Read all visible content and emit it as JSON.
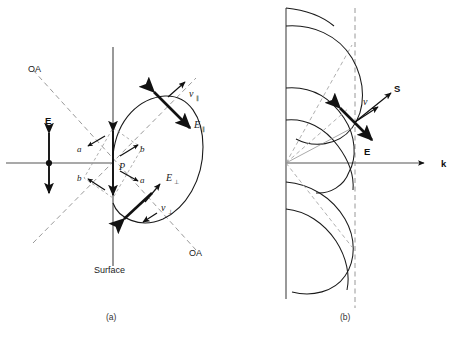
{
  "figure": {
    "type": "optics-diagram",
    "captions": {
      "panel_a": "(a)",
      "panel_b": "(b)"
    }
  },
  "panel_a": {
    "caption": "(a)",
    "surface_label": "Surface",
    "optic_axis_label_top": "OA",
    "optic_axis_label_bottom": "OA",
    "point_label": "P",
    "field_label": "E",
    "component_labels": {
      "a_upper": "a",
      "b_upper": "b",
      "b_lower": "b",
      "a_lower": "a"
    },
    "vectors": [
      {
        "name": "v-parallel",
        "base": "v",
        "subscript": "∥"
      },
      {
        "name": "E-parallel",
        "base": "E",
        "subscript": "∥"
      },
      {
        "name": "E-perpendicular",
        "base": "E",
        "subscript": "⊥"
      },
      {
        "name": "v-perpendicular",
        "base": "v",
        "subscript": "⊥"
      }
    ]
  },
  "panel_b": {
    "caption": "(b)",
    "axis_label_k": "k",
    "vector_S": "S",
    "vector_v": "v",
    "vector_E": "E",
    "lobe_count": 3
  },
  "colors": {
    "ink": "#1a1a1a",
    "axis": "#555555",
    "dashed": "#8d8d8d",
    "background": "#ffffff"
  }
}
